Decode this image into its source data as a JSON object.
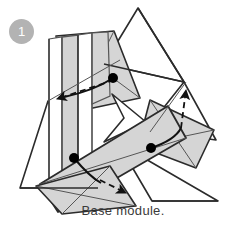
{
  "figure": {
    "kind": "origami-instruction-diagram",
    "step_badge": {
      "label": "1",
      "background_color": "#b3b3b3",
      "text_color": "#ffffff"
    },
    "caption": "Base module.",
    "caption_color": "#3a3a3a",
    "palette": {
      "paper_front": "#d5d5d5",
      "paper_back": "#ffffff",
      "paper_shadow": "#c2c2c2",
      "outline": "#2b2b2b",
      "thin_line": "#555555",
      "fold_arrow": "#1a1a1a",
      "anchor_dot": "#000000",
      "background": "#ffffff"
    },
    "shapes": [
      {
        "name": "back-triangle-top",
        "fill": "#ffffff",
        "stroke": "#2b2b2b",
        "points": "138,8 104,64 184,82"
      },
      {
        "name": "back-triangle-right",
        "fill": "#ffffff",
        "stroke": "#2b2b2b",
        "points": "184,82 214,138 150,132"
      },
      {
        "name": "left-triangle-white",
        "fill": "#ffffff",
        "stroke": "#2b2b2b",
        "points": "48,103 21,187 96,187"
      },
      {
        "name": "bottom-right-triangle",
        "fill": "#ffffff",
        "stroke": "#2b2b2b",
        "points": "120,144 150,200 216,200"
      },
      {
        "name": "upper-panel-gray",
        "fill": "#d5d5d5",
        "stroke": "#2b2b2b",
        "points": "55,38 112,33 136,95 72,110"
      },
      {
        "name": "left-column-strip-a",
        "fill": "#ffffff",
        "stroke": "#555555",
        "points": "49,39 62,37 62,176 49,178"
      },
      {
        "name": "left-column-strip-b",
        "fill": "#d5d5d5",
        "stroke": "#555555",
        "points": "62,37 78,35 78,174 62,176"
      },
      {
        "name": "left-column-strip-c",
        "fill": "#ffffff",
        "stroke": "#555555",
        "points": "78,35 90,34 90,173 78,174"
      },
      {
        "name": "diagonal-band-main",
        "fill": "#d5d5d5",
        "stroke": "#2b2b2b",
        "points": "42,186 164,110 180,136 58,209"
      },
      {
        "name": "band-highlight",
        "fill": "#d5d5d5",
        "stroke": "#2b2b2b",
        "points": "96,122 150,104 168,140 112,158"
      },
      {
        "name": "lower-left-flap",
        "fill": "#d5d5d5",
        "stroke": "#2b2b2b",
        "points": "38,185 108,168 130,205 60,212"
      },
      {
        "name": "right-wing",
        "fill": "#d5d5d5",
        "stroke": "#2b2b2b",
        "points": "150,104 212,131 196,166 140,148"
      },
      {
        "name": "center-notch",
        "fill": "#ffffff",
        "stroke": "#2b2b2b",
        "points": "108,96 140,120 104,140 120,116"
      }
    ],
    "anchor_dots": [
      {
        "name": "anchor-dot-upper",
        "cx": 113,
        "cy": 78,
        "r": 5
      },
      {
        "name": "anchor-dot-lower-left",
        "cx": 74,
        "cy": 158,
        "r": 5
      },
      {
        "name": "anchor-dot-right",
        "cx": 151,
        "cy": 148,
        "r": 5
      }
    ],
    "fold_arrows": [
      {
        "name": "fold-arrow-left",
        "solid_path": "M113,78 C96,86 76,92 62,96",
        "dashed_path": "M113,80 L56,99",
        "arrow_tip": "48,101",
        "direction": "left"
      },
      {
        "name": "fold-arrow-lower",
        "solid_path": "M74,158 C84,168 92,176 100,182",
        "dashed_path": "M100,180 L124,192",
        "arrow_tip": "132,195",
        "direction": "right-down"
      },
      {
        "name": "fold-arrow-up",
        "solid_path": "M151,148 C166,142 176,134 180,126",
        "dashed_path": "M180,126 L186,88",
        "arrow_tip": "186,80",
        "direction": "up"
      }
    ]
  }
}
